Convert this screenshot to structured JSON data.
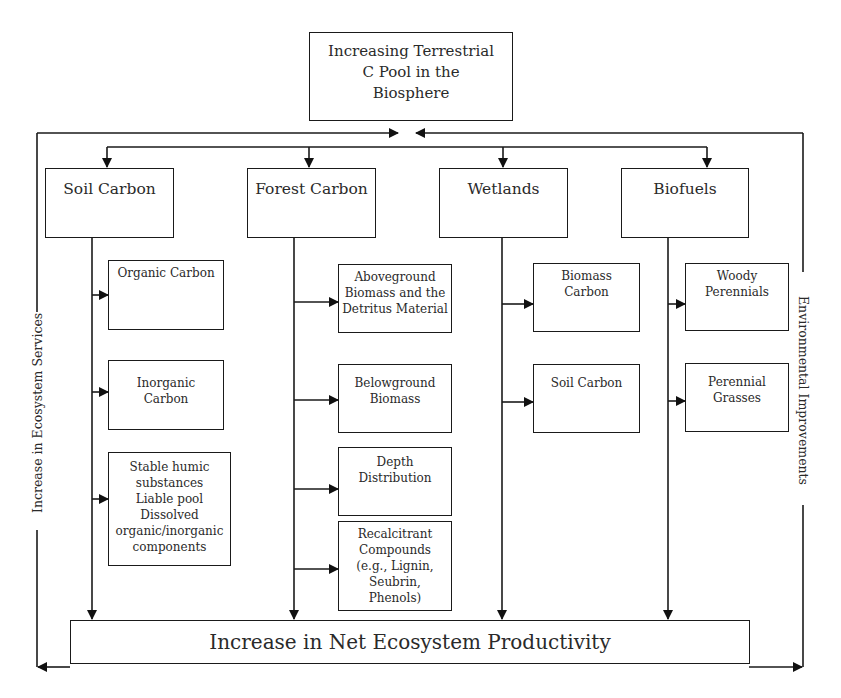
{
  "diagram": {
    "top": {
      "label": "Increasing Terrestrial\nC Pool in the\nBiosphere"
    },
    "categories": [
      {
        "label": "Soil Carbon",
        "items": [
          "Organic Carbon",
          "Inorganic\nCarbon",
          "Stable humic\nsubstances\nLiable pool\nDissolved\norganic/inorganic\ncomponents"
        ]
      },
      {
        "label": "Forest Carbon",
        "items": [
          "Aboveground\nBiomass and the\nDetritus Material",
          "Belowground\nBiomass",
          "Depth\nDistribution",
          "Recalcitrant\nCompounds\n(e.g., Lignin,\nSeubrin,\nPhenols)"
        ]
      },
      {
        "label": "Wetlands",
        "items": [
          "Biomass\nCarbon",
          "Soil Carbon"
        ]
      },
      {
        "label": "Biofuels",
        "items": [
          "Woody\nPerennials",
          "Perennial\nGrasses"
        ]
      }
    ],
    "bottom": {
      "label": "Increase in Net Ecosystem Productivity"
    },
    "left_side_label": "Increase in Ecosystem Services",
    "right_side_label": "Environmental Improvements"
  }
}
